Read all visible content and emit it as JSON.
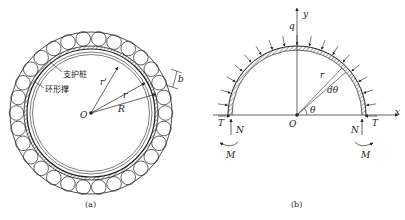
{
  "figure_a": {
    "caption": "(a)",
    "labels": {
      "pile": "支护桩",
      "ring_support": "环形撑",
      "origin": "O",
      "r_prime": "r'",
      "r": "r",
      "R": "R",
      "b": "b"
    }
  },
  "figure_b": {
    "caption": "(b)",
    "labels": {
      "y_axis": "y",
      "x_axis": "x",
      "load": "q",
      "origin": "O",
      "radius": "r",
      "dtheta": "dθ",
      "theta": "θ",
      "T_left": "T",
      "N_left": "N",
      "M_left": "M",
      "T_right": "T",
      "N_right": "N",
      "M_right": "M"
    }
  },
  "colors": {
    "stroke": "#222222",
    "background": "#ffffff"
  }
}
